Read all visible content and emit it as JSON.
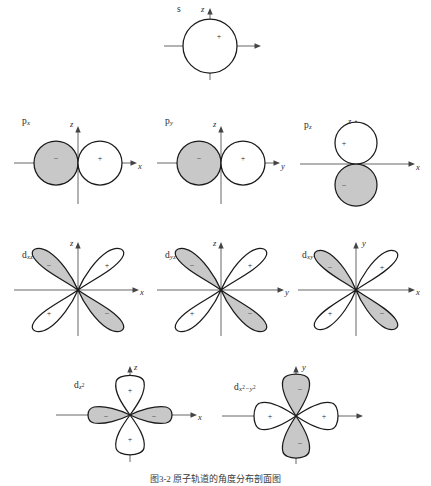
{
  "figure": {
    "title_caption": "图3-2  原子轨道的角度分布剖面图",
    "background_color": "#ffffff",
    "lobe_positive_fill": "#ffffff",
    "lobe_negative_fill": "#c8c8c8",
    "stroke_color": "#1a1a1a",
    "axis_color": "#555555",
    "sign_positive": "+",
    "sign_negative": "−"
  },
  "orbitals": [
    {
      "id": "s",
      "name": "s-orbital",
      "label_main": "s",
      "label_sub": "",
      "shape": "sphere",
      "axes": {
        "vertical": "z",
        "horizontal": ""
      },
      "lobes": [
        {
          "sign": "+",
          "fill": "positive",
          "direction": "all"
        }
      ]
    },
    {
      "id": "px",
      "name": "p-x-orbital",
      "label_main": "p",
      "label_sub": "x",
      "shape": "two-circles-horizontal",
      "axes": {
        "vertical": "z",
        "horizontal": "x"
      },
      "lobes": [
        {
          "sign": "−",
          "fill": "negative",
          "direction": "left"
        },
        {
          "sign": "+",
          "fill": "positive",
          "direction": "right"
        }
      ]
    },
    {
      "id": "py",
      "name": "p-y-orbital",
      "label_main": "p",
      "label_sub": "y",
      "shape": "two-circles-horizontal",
      "axes": {
        "vertical": "z",
        "horizontal": "y"
      },
      "lobes": [
        {
          "sign": "−",
          "fill": "negative",
          "direction": "left"
        },
        {
          "sign": "+",
          "fill": "positive",
          "direction": "right"
        }
      ]
    },
    {
      "id": "pz",
      "name": "p-z-orbital",
      "label_main": "p",
      "label_sub": "z",
      "shape": "two-circles-vertical",
      "axes": {
        "vertical": "z",
        "horizontal": "x"
      },
      "lobes": [
        {
          "sign": "+",
          "fill": "positive",
          "direction": "up"
        },
        {
          "sign": "−",
          "fill": "negative",
          "direction": "down"
        }
      ]
    },
    {
      "id": "dxz",
      "name": "d-xz-orbital",
      "label_main": "d",
      "label_sub": "xz",
      "shape": "four-lobe-diagonal",
      "axes": {
        "vertical": "z",
        "horizontal": "x"
      },
      "lobes": [
        {
          "sign": "+",
          "fill": "positive",
          "direction": "upper-right"
        },
        {
          "sign": "−",
          "fill": "negative",
          "direction": "upper-left"
        },
        {
          "sign": "+",
          "fill": "positive",
          "direction": "lower-left"
        },
        {
          "sign": "−",
          "fill": "negative",
          "direction": "lower-right"
        }
      ]
    },
    {
      "id": "dyz",
      "name": "d-yz-orbital",
      "label_main": "d",
      "label_sub": "yz",
      "shape": "four-lobe-diagonal",
      "axes": {
        "vertical": "z",
        "horizontal": "y"
      },
      "lobes": [
        {
          "sign": "+",
          "fill": "positive",
          "direction": "upper-right"
        },
        {
          "sign": "−",
          "fill": "negative",
          "direction": "upper-left"
        },
        {
          "sign": "+",
          "fill": "positive",
          "direction": "lower-left"
        },
        {
          "sign": "−",
          "fill": "negative",
          "direction": "lower-right"
        }
      ]
    },
    {
      "id": "dxy",
      "name": "d-xy-orbital",
      "label_main": "d",
      "label_sub": "xy",
      "shape": "four-lobe-diagonal",
      "axes": {
        "vertical": "y",
        "horizontal": "x"
      },
      "lobes": [
        {
          "sign": "+",
          "fill": "positive",
          "direction": "upper-right"
        },
        {
          "sign": "−",
          "fill": "negative",
          "direction": "upper-left"
        },
        {
          "sign": "+",
          "fill": "positive",
          "direction": "lower-left"
        },
        {
          "sign": "−",
          "fill": "negative",
          "direction": "lower-right"
        }
      ]
    },
    {
      "id": "dz2",
      "name": "d-z-squared-orbital",
      "label_main": "d",
      "label_sub": "z",
      "label_sub_sup": "2",
      "shape": "dz2",
      "axes": {
        "vertical": "z",
        "horizontal": "x"
      },
      "lobes": [
        {
          "sign": "+",
          "fill": "positive",
          "direction": "up"
        },
        {
          "sign": "+",
          "fill": "positive",
          "direction": "down"
        },
        {
          "sign": "−",
          "fill": "negative",
          "direction": "left"
        },
        {
          "sign": "−",
          "fill": "negative",
          "direction": "right"
        }
      ]
    },
    {
      "id": "dx2y2",
      "name": "d-x-squared-minus-y-squared-orbital",
      "label_main": "d",
      "label_sub": "x",
      "label_sub_sup": "2",
      "label_sub2": "−y",
      "label_sub2_sup": "2",
      "shape": "four-lobe-axial",
      "axes": {
        "vertical": "y",
        "horizontal": "x"
      },
      "lobes": [
        {
          "sign": "+",
          "fill": "positive",
          "direction": "left"
        },
        {
          "sign": "+",
          "fill": "positive",
          "direction": "right"
        },
        {
          "sign": "−",
          "fill": "negative",
          "direction": "up"
        },
        {
          "sign": "−",
          "fill": "negative",
          "direction": "down"
        }
      ]
    }
  ]
}
